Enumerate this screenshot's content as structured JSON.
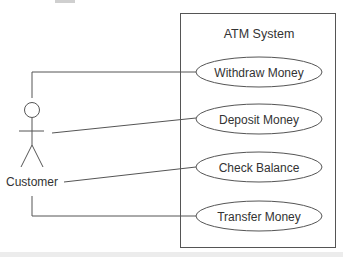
{
  "diagram": {
    "type": "use-case",
    "cropped_title_fragment": "",
    "system": {
      "label": "ATM System",
      "box": {
        "x": 180,
        "y": 13,
        "w": 156,
        "h": 234
      }
    },
    "actor": {
      "label": "Customer",
      "head": {
        "cx": 32,
        "cy": 110,
        "r": 8
      }
    },
    "use_cases": [
      {
        "label": "Withdraw Money",
        "cx": 259,
        "cy": 72
      },
      {
        "label": "Deposit Money",
        "cx": 259,
        "cy": 119
      },
      {
        "label": "Check Balance",
        "cx": 259,
        "cy": 167
      },
      {
        "label": "Transfer Money",
        "cx": 259,
        "cy": 216
      }
    ],
    "colors": {
      "stroke": "#555555",
      "text": "#333333",
      "background": "#ffffff",
      "bottom_band": "#ececec"
    }
  }
}
